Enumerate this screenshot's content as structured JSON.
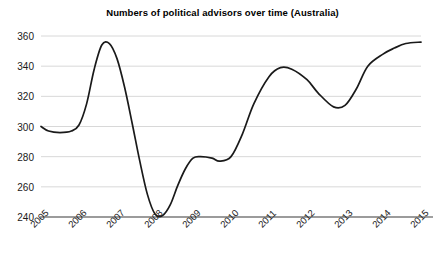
{
  "chart_data": {
    "type": "line",
    "title": "Numbers of political advisors over time (Australia)",
    "xlabel": "",
    "ylabel": "",
    "xlim": [
      2005,
      2015
    ],
    "ylim": [
      240,
      360
    ],
    "grid": true,
    "legend": false,
    "line_color": "#1a1a1a",
    "grid_color": "#d8d8d8",
    "axis_color": "#808080",
    "y_ticks": [
      240,
      260,
      280,
      300,
      320,
      340,
      360
    ],
    "x_ticks": [
      "2005",
      "2006",
      "2007",
      "2008",
      "2009",
      "2010",
      "2011",
      "2012",
      "2013",
      "2014",
      "2015"
    ],
    "series": [
      {
        "name": "Political advisors",
        "x": [
          2005.0,
          2005.2,
          2005.5,
          2005.8,
          2006.0,
          2006.2,
          2006.4,
          2006.6,
          2006.8,
          2007.0,
          2007.2,
          2007.4,
          2007.6,
          2007.8,
          2008.0,
          2008.2,
          2008.4,
          2008.6,
          2008.8,
          2009.0,
          2009.2,
          2009.5,
          2009.7,
          2010.0,
          2010.3,
          2010.6,
          2011.0,
          2011.3,
          2011.6,
          2012.0,
          2012.3,
          2012.7,
          2013.0,
          2013.3,
          2013.6,
          2014.0,
          2014.3,
          2014.6,
          2015.0
        ],
        "y": [
          300,
          297,
          296,
          297,
          301,
          315,
          338,
          354,
          355,
          345,
          326,
          302,
          277,
          255,
          242,
          241,
          248,
          261,
          272,
          279,
          280,
          279,
          277,
          280,
          295,
          315,
          333,
          339,
          338,
          331,
          322,
          313,
          314,
          325,
          340,
          348,
          352,
          355,
          356
        ]
      }
    ],
    "annotations": {
      "start_value": 300,
      "peak_value": 355,
      "peak_year": "2007",
      "trough_value": 241,
      "trough_year": "2008",
      "end_value": 356,
      "end_year": "2015"
    }
  }
}
